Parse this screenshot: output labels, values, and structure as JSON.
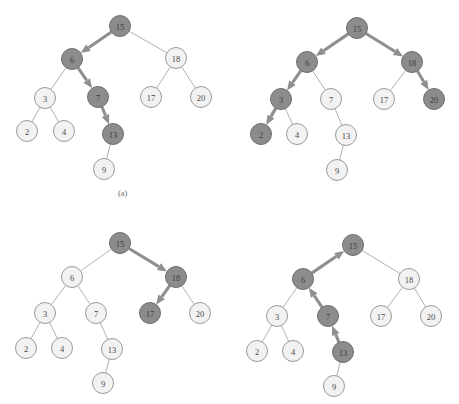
{
  "figure": {
    "caption_a": "(a)",
    "caption_a_x": 118,
    "caption_a_y": 188,
    "colors": {
      "node_light_fill": "#f2f2f2",
      "node_light_stroke": "#9a9a9a",
      "node_dark_fill": "#8c8c8c",
      "node_dark_stroke": "#6e6e6e",
      "edge_plain": "#a8a8a8",
      "edge_arrow": "#8f8f8f",
      "label_text": "#4a4a4a",
      "background": "#ffffff"
    },
    "node_radius": 10.5,
    "panels": [
      {
        "id": "panel-top-left",
        "name": "bst-search-step-1",
        "nodes": [
          {
            "key": "n15",
            "label": "15",
            "x": 120,
            "y": 26,
            "highlight": true
          },
          {
            "key": "n6",
            "label": "6",
            "x": 72,
            "y": 59,
            "highlight": true
          },
          {
            "key": "n18",
            "label": "18",
            "x": 176,
            "y": 58,
            "highlight": false
          },
          {
            "key": "n3",
            "label": "3",
            "x": 45,
            "y": 98,
            "highlight": false
          },
          {
            "key": "n7",
            "label": "7",
            "x": 98,
            "y": 97,
            "highlight": true
          },
          {
            "key": "n17",
            "label": "17",
            "x": 151,
            "y": 97,
            "highlight": false
          },
          {
            "key": "n20",
            "label": "20",
            "x": 201,
            "y": 97,
            "highlight": false
          },
          {
            "key": "n2",
            "label": "2",
            "x": 27,
            "y": 131,
            "highlight": false
          },
          {
            "key": "n4",
            "label": "4",
            "x": 64,
            "y": 131,
            "highlight": false
          },
          {
            "key": "n13",
            "label": "13",
            "x": 113,
            "y": 134,
            "highlight": true
          },
          {
            "key": "n9",
            "label": "9",
            "x": 104,
            "y": 169,
            "highlight": false
          }
        ],
        "edges": [
          {
            "from": "n15",
            "to": "n6",
            "arrow": true,
            "direction": "down"
          },
          {
            "from": "n15",
            "to": "n18",
            "arrow": false,
            "direction": "down"
          },
          {
            "from": "n6",
            "to": "n3",
            "arrow": false,
            "direction": "down"
          },
          {
            "from": "n6",
            "to": "n7",
            "arrow": true,
            "direction": "down"
          },
          {
            "from": "n18",
            "to": "n17",
            "arrow": false,
            "direction": "down"
          },
          {
            "from": "n18",
            "to": "n20",
            "arrow": false,
            "direction": "down"
          },
          {
            "from": "n3",
            "to": "n2",
            "arrow": false,
            "direction": "down"
          },
          {
            "from": "n3",
            "to": "n4",
            "arrow": false,
            "direction": "down"
          },
          {
            "from": "n7",
            "to": "n13",
            "arrow": true,
            "direction": "down"
          },
          {
            "from": "n13",
            "to": "n9",
            "arrow": false,
            "direction": "down"
          }
        ]
      },
      {
        "id": "panel-top-right",
        "name": "bst-search-step-2",
        "nodes": [
          {
            "key": "n15",
            "label": "15",
            "x": 357,
            "y": 28,
            "highlight": true
          },
          {
            "key": "n6",
            "label": "6",
            "x": 307,
            "y": 62,
            "highlight": true
          },
          {
            "key": "n18",
            "label": "18",
            "x": 412,
            "y": 62,
            "highlight": true
          },
          {
            "key": "n3",
            "label": "3",
            "x": 281,
            "y": 99,
            "highlight": true
          },
          {
            "key": "n7",
            "label": "7",
            "x": 331,
            "y": 99,
            "highlight": false
          },
          {
            "key": "n17",
            "label": "17",
            "x": 384,
            "y": 99,
            "highlight": false
          },
          {
            "key": "n20",
            "label": "20",
            "x": 434,
            "y": 99,
            "highlight": true
          },
          {
            "key": "n2",
            "label": "2",
            "x": 261,
            "y": 134,
            "highlight": true
          },
          {
            "key": "n4",
            "label": "4",
            "x": 297,
            "y": 134,
            "highlight": false
          },
          {
            "key": "n13",
            "label": "13",
            "x": 346,
            "y": 135,
            "highlight": false
          },
          {
            "key": "n9",
            "label": "9",
            "x": 337,
            "y": 170,
            "highlight": false
          }
        ],
        "edges": [
          {
            "from": "n15",
            "to": "n6",
            "arrow": true,
            "direction": "down"
          },
          {
            "from": "n15",
            "to": "n18",
            "arrow": true,
            "direction": "down"
          },
          {
            "from": "n6",
            "to": "n3",
            "arrow": true,
            "direction": "down"
          },
          {
            "from": "n6",
            "to": "n7",
            "arrow": false,
            "direction": "down"
          },
          {
            "from": "n18",
            "to": "n17",
            "arrow": false,
            "direction": "down"
          },
          {
            "from": "n18",
            "to": "n20",
            "arrow": true,
            "direction": "down"
          },
          {
            "from": "n3",
            "to": "n2",
            "arrow": true,
            "direction": "down"
          },
          {
            "from": "n3",
            "to": "n4",
            "arrow": false,
            "direction": "down"
          },
          {
            "from": "n7",
            "to": "n13",
            "arrow": false,
            "direction": "down"
          },
          {
            "from": "n13",
            "to": "n9",
            "arrow": false,
            "direction": "down"
          }
        ]
      },
      {
        "id": "panel-bottom-left",
        "name": "bst-search-step-3",
        "nodes": [
          {
            "key": "n15",
            "label": "15",
            "x": 120,
            "y": 243,
            "highlight": true
          },
          {
            "key": "n6",
            "label": "6",
            "x": 72,
            "y": 277,
            "highlight": false
          },
          {
            "key": "n18",
            "label": "18",
            "x": 176,
            "y": 277,
            "highlight": true
          },
          {
            "key": "n3",
            "label": "3",
            "x": 45,
            "y": 313,
            "highlight": false
          },
          {
            "key": "n7",
            "label": "7",
            "x": 96,
            "y": 313,
            "highlight": false
          },
          {
            "key": "n17",
            "label": "17",
            "x": 150,
            "y": 313,
            "highlight": true
          },
          {
            "key": "n20",
            "label": "20",
            "x": 200,
            "y": 313,
            "highlight": false
          },
          {
            "key": "n2",
            "label": "2",
            "x": 26,
            "y": 348,
            "highlight": false
          },
          {
            "key": "n4",
            "label": "4",
            "x": 62,
            "y": 348,
            "highlight": false
          },
          {
            "key": "n13",
            "label": "13",
            "x": 112,
            "y": 349,
            "highlight": false
          },
          {
            "key": "n9",
            "label": "9",
            "x": 103,
            "y": 383,
            "highlight": false
          }
        ],
        "edges": [
          {
            "from": "n15",
            "to": "n6",
            "arrow": false,
            "direction": "down"
          },
          {
            "from": "n15",
            "to": "n18",
            "arrow": true,
            "direction": "down"
          },
          {
            "from": "n6",
            "to": "n3",
            "arrow": false,
            "direction": "down"
          },
          {
            "from": "n6",
            "to": "n7",
            "arrow": false,
            "direction": "down"
          },
          {
            "from": "n18",
            "to": "n17",
            "arrow": true,
            "direction": "down"
          },
          {
            "from": "n18",
            "to": "n20",
            "arrow": false,
            "direction": "down"
          },
          {
            "from": "n3",
            "to": "n2",
            "arrow": false,
            "direction": "down"
          },
          {
            "from": "n3",
            "to": "n4",
            "arrow": false,
            "direction": "down"
          },
          {
            "from": "n7",
            "to": "n13",
            "arrow": false,
            "direction": "down"
          },
          {
            "from": "n13",
            "to": "n9",
            "arrow": false,
            "direction": "down"
          }
        ]
      },
      {
        "id": "panel-bottom-right",
        "name": "bst-search-step-4",
        "nodes": [
          {
            "key": "n15",
            "label": "15",
            "x": 353,
            "y": 245,
            "highlight": true
          },
          {
            "key": "n6",
            "label": "6",
            "x": 303,
            "y": 279,
            "highlight": true
          },
          {
            "key": "n18",
            "label": "18",
            "x": 409,
            "y": 279,
            "highlight": false
          },
          {
            "key": "n3",
            "label": "3",
            "x": 277,
            "y": 316,
            "highlight": false
          },
          {
            "key": "n7",
            "label": "7",
            "x": 328,
            "y": 316,
            "highlight": true
          },
          {
            "key": "n17",
            "label": "17",
            "x": 381,
            "y": 316,
            "highlight": false
          },
          {
            "key": "n20",
            "label": "20",
            "x": 431,
            "y": 316,
            "highlight": false
          },
          {
            "key": "n2",
            "label": "2",
            "x": 257,
            "y": 351,
            "highlight": false
          },
          {
            "key": "n4",
            "label": "4",
            "x": 293,
            "y": 351,
            "highlight": false
          },
          {
            "key": "n13",
            "label": "13",
            "x": 343,
            "y": 352,
            "highlight": true
          },
          {
            "key": "n9",
            "label": "9",
            "x": 334,
            "y": 386,
            "highlight": false
          }
        ],
        "edges": [
          {
            "from": "n6",
            "to": "n15",
            "arrow": true,
            "direction": "up"
          },
          {
            "from": "n15",
            "to": "n18",
            "arrow": false,
            "direction": "down"
          },
          {
            "from": "n6",
            "to": "n3",
            "arrow": false,
            "direction": "down"
          },
          {
            "from": "n7",
            "to": "n6",
            "arrow": true,
            "direction": "up"
          },
          {
            "from": "n18",
            "to": "n17",
            "arrow": false,
            "direction": "down"
          },
          {
            "from": "n18",
            "to": "n20",
            "arrow": false,
            "direction": "down"
          },
          {
            "from": "n3",
            "to": "n2",
            "arrow": false,
            "direction": "down"
          },
          {
            "from": "n3",
            "to": "n4",
            "arrow": false,
            "direction": "down"
          },
          {
            "from": "n13",
            "to": "n7",
            "arrow": true,
            "direction": "up"
          },
          {
            "from": "n13",
            "to": "n9",
            "arrow": false,
            "direction": "down"
          }
        ]
      }
    ]
  }
}
